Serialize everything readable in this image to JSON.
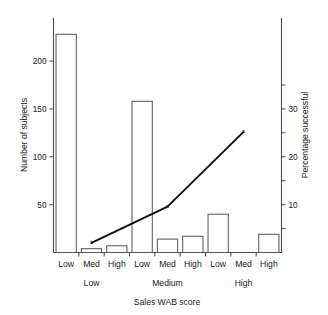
{
  "chart_data": {
    "type": "bar",
    "title": "",
    "xlabel": "Sales WAB score",
    "ylabel": "Number of subjects",
    "y2label": "Percentage successful",
    "grid": false,
    "legend": "none",
    "categories": [
      "Low",
      "Med",
      "High",
      "Low",
      "Med",
      "High",
      "Low",
      "Med",
      "High"
    ],
    "group_labels": [
      "Low",
      "Medium",
      "High"
    ],
    "values": [
      228,
      4,
      7,
      158,
      14,
      17,
      40,
      0,
      19
    ],
    "ylim": [
      0,
      245
    ],
    "y2lim": [
      0,
      49
    ],
    "yticks": [
      50,
      100,
      150,
      200
    ],
    "ytick_labels": [
      "50",
      "100",
      "150",
      "200"
    ],
    "y2ticks": [
      10,
      20,
      30
    ],
    "y2tick_labels": [
      "10",
      "20",
      "30"
    ],
    "y2minor_ticks": [
      5,
      15,
      25,
      35
    ],
    "series": [
      {
        "name": "Number of subjects",
        "axis": "left",
        "type": "bar",
        "values": [
          228,
          4,
          7,
          158,
          14,
          17,
          40,
          0,
          19
        ]
      },
      {
        "name": "Percentage successful",
        "axis": "right",
        "type": "line",
        "marker": "x",
        "x": [
          "Low",
          "Medium",
          "High"
        ],
        "values": [
          2.0,
          9.6,
          25.2
        ]
      }
    ]
  },
  "axes": {
    "left": {
      "title": "Number of subjects",
      "ticks": [
        {
          "label": "200",
          "value": 200
        },
        {
          "label": "150",
          "value": 150
        },
        {
          "label": "100",
          "value": 100
        },
        {
          "label": "50",
          "value": 50
        }
      ]
    },
    "right": {
      "title": "Percentage successful",
      "ticks": [
        {
          "label": "30",
          "value": 30
        },
        {
          "label": "20",
          "value": 20
        },
        {
          "label": "10",
          "value": 10
        }
      ]
    },
    "bottom": {
      "title": "Sales WAB score",
      "categories": [
        {
          "label": "Low"
        },
        {
          "label": "Med"
        },
        {
          "label": "High"
        },
        {
          "label": "Low"
        },
        {
          "label": "Med"
        },
        {
          "label": "High"
        },
        {
          "label": "Low"
        },
        {
          "label": "Med"
        },
        {
          "label": "High"
        }
      ],
      "groups": [
        {
          "label": "Low"
        },
        {
          "label": "Medium"
        },
        {
          "label": "High"
        }
      ]
    }
  }
}
